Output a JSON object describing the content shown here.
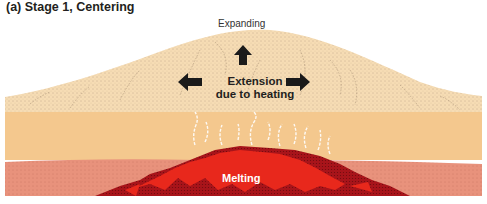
{
  "title": "(a) Stage 1, Centering",
  "labels": {
    "expanding": "Expanding",
    "extension_line1": "Extension",
    "extension_line2": "due to heating",
    "melting": "Melting"
  },
  "colors": {
    "upper_crust": "#f6dcb4",
    "lower_crust": "#f4c88e",
    "mantle_layer": "#e8927c",
    "melt_dark": "#a8141a",
    "melt_bright": "#e8281c",
    "arrow": "#1a1a1a",
    "vapor": "#ffffff"
  },
  "arrows": [
    "up-arrow",
    "left-arrow",
    "right-arrow"
  ]
}
